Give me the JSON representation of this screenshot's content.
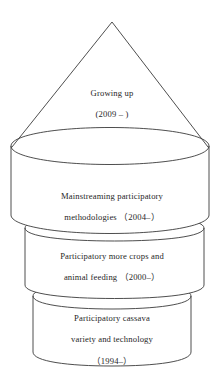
{
  "diagram": {
    "type": "stacked-cylinder-pyramid",
    "orientation": "vertical",
    "stroke_color": "#3a3a3a",
    "fill_color": "#ffffff",
    "text_color": "#1f1f1f",
    "levels": [
      {
        "id": "cone",
        "shape": "cone",
        "position": "top",
        "lines": [
          "Growing up",
          "(2009 – )"
        ],
        "period": "2009 –"
      },
      {
        "id": "cylinder-1",
        "shape": "cylinder",
        "position": "upper",
        "lines": [
          "Mainstreaming participatory",
          "methodologies （2004–）"
        ],
        "period": "2004–"
      },
      {
        "id": "cylinder-2",
        "shape": "cylinder",
        "position": "middle",
        "lines": [
          "Participatory more crops and",
          "animal feeding （2000–）"
        ],
        "period": "2000–"
      },
      {
        "id": "cylinder-3",
        "shape": "cylinder",
        "position": "bottom",
        "lines": [
          "Participatory cassava",
          "variety and technology",
          "（1994–）"
        ],
        "period": "1994–"
      }
    ]
  }
}
